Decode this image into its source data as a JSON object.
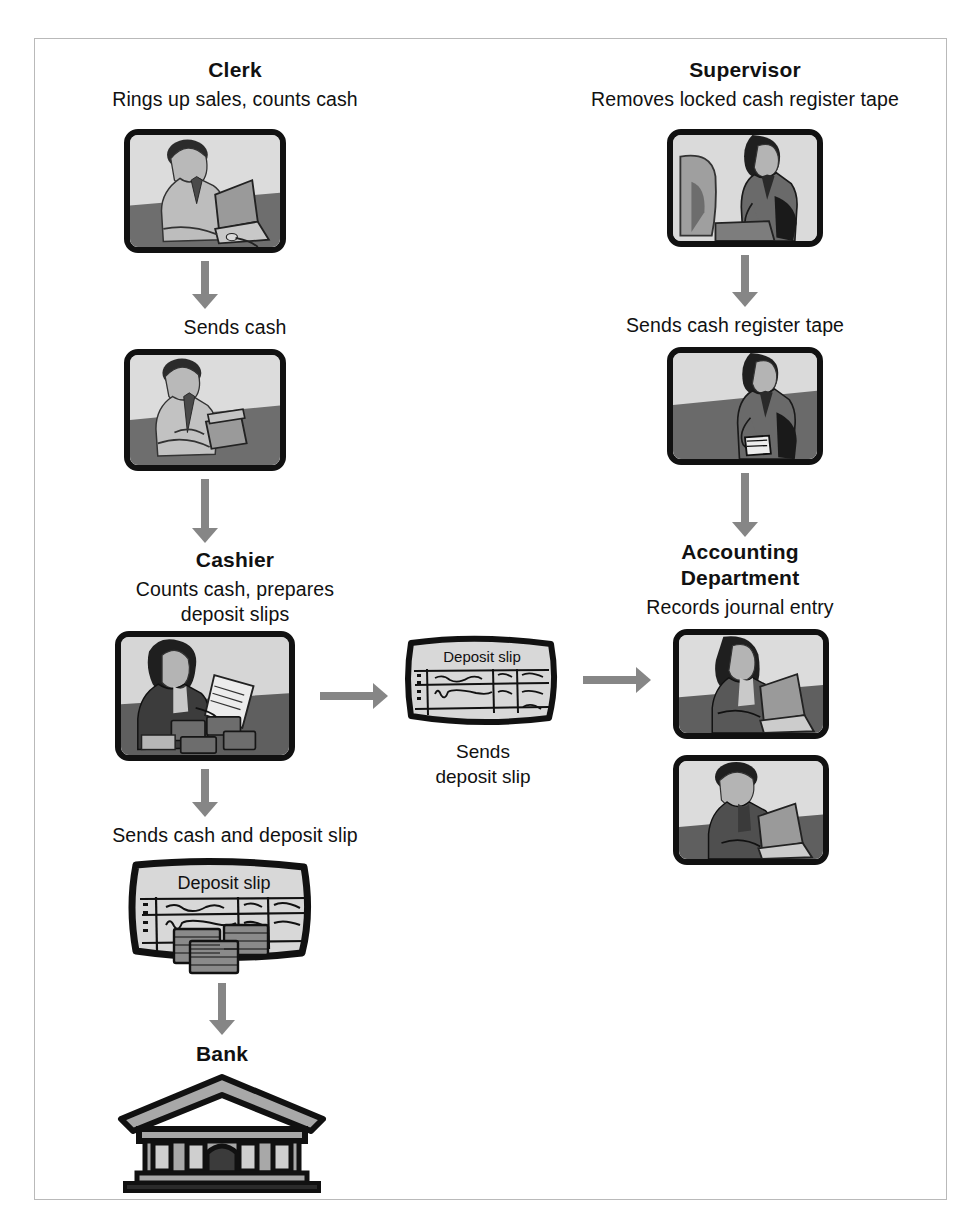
{
  "diagram": {
    "accent_gray": "#868686",
    "ink": "#111111",
    "fill_gray": "#a8a8a8",
    "frame_border": "#b9b9b9"
  },
  "clerk": {
    "role": "Clerk",
    "duty": "Rings up sales, counts cash",
    "image_1": "clerk-at-laptop-illustration",
    "flow_label": "Sends cash",
    "image_2": "clerk-counting-cash-illustration"
  },
  "supervisor": {
    "role": "Supervisor",
    "duty": "Removes locked cash register tape",
    "image_1": "supervisor-at-register-illustration",
    "flow_label": "Sends cash register tape",
    "image_2": "supervisor-holding-tape-illustration"
  },
  "cashier": {
    "role": "Cashier",
    "duty": "Counts cash, prepares\ndeposit slips",
    "image_1": "cashier-with-deposit-slip-illustration",
    "flow_label": "Sends cash and deposit slip",
    "image_2": "deposit-slip-with-cash-illustration"
  },
  "accounting": {
    "role": "Accounting\nDepartment",
    "duty": "Records journal entry",
    "image_1": "accountant-woman-at-laptop-illustration",
    "image_2": "accountant-man-at-laptop-illustration"
  },
  "middle": {
    "slip_label": "Deposit slip",
    "flow_label": "Sends\ndeposit slip",
    "image": "deposit-slip-illustration"
  },
  "bank": {
    "role": "Bank",
    "image": "bank-building-illustration"
  },
  "arrows": [
    {
      "name": "clerk-to-sends-cash",
      "direction": "down"
    },
    {
      "name": "clerk-to-cashier",
      "direction": "down"
    },
    {
      "name": "supervisor-to-sends-tape",
      "direction": "down"
    },
    {
      "name": "supervisor-to-accounting",
      "direction": "down"
    },
    {
      "name": "cashier-to-sends-cash-and-slip",
      "direction": "down"
    },
    {
      "name": "cashier-cash-to-bank",
      "direction": "down"
    },
    {
      "name": "cashier-to-deposit-slip",
      "direction": "right"
    },
    {
      "name": "deposit-slip-to-accounting",
      "direction": "right"
    }
  ]
}
